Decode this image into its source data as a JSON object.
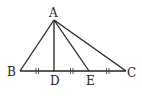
{
  "diagram": {
    "type": "geometry-triangle",
    "points": {
      "A": {
        "label": "A",
        "x": 54,
        "y": 20
      },
      "B": {
        "label": "B",
        "x": 20,
        "y": 71
      },
      "C": {
        "label": "C",
        "x": 126,
        "y": 71
      },
      "D": {
        "label": "D",
        "x": 54,
        "y": 71
      },
      "E": {
        "label": "E",
        "x": 89,
        "y": 71
      }
    },
    "segments": [
      "AB",
      "AC",
      "BC",
      "AD",
      "AE"
    ],
    "equal_marks": [
      "BD",
      "DE",
      "EC"
    ],
    "stroke_color": "#222222"
  }
}
